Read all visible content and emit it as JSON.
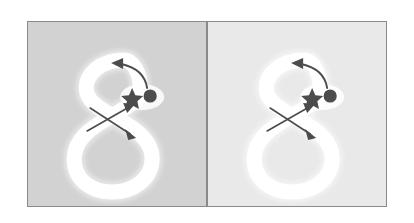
{
  "figure": {
    "background_color": "#ffffff",
    "border_color": "#8a8a8a",
    "marker_color": "#4c4c4c",
    "path_color": "#ffffff",
    "panels": [
      {
        "id": "panel-left",
        "label": "left-panel",
        "background_color": "#d2d2d2",
        "shape": "figure-eight",
        "markers": [
          {
            "name": "dot-marker",
            "glyph": "filled-circle",
            "color": "#4c4c4c",
            "x": 122,
            "y": 74
          },
          {
            "name": "star-marker",
            "glyph": "five-point-star",
            "color": "#4c4c4c",
            "x": 104,
            "y": 76
          }
        ],
        "arrows": [
          {
            "name": "curved-arrow",
            "style": "curved",
            "direction": "up-left",
            "color": "#4c4c4c"
          },
          {
            "name": "straight-arrow-up",
            "style": "straight",
            "direction": "up-right",
            "color": "#4c4c4c"
          },
          {
            "name": "straight-arrow-down",
            "style": "straight",
            "direction": "down-right",
            "color": "#4c4c4c"
          }
        ]
      },
      {
        "id": "panel-right",
        "label": "right-panel",
        "background_color": "#e9e9e9",
        "shape": "figure-eight",
        "markers": [
          {
            "name": "dot-marker",
            "glyph": "filled-circle",
            "color": "#4c4c4c",
            "x": 122,
            "y": 74
          },
          {
            "name": "star-marker",
            "glyph": "five-point-star",
            "color": "#4c4c4c",
            "x": 104,
            "y": 76
          }
        ],
        "arrows": [
          {
            "name": "curved-arrow",
            "style": "curved",
            "direction": "up-left",
            "color": "#4c4c4c"
          },
          {
            "name": "straight-arrow-up",
            "style": "straight",
            "direction": "up-right",
            "color": "#4c4c4c"
          },
          {
            "name": "straight-arrow-down",
            "style": "straight",
            "direction": "down-right",
            "color": "#4c4c4c"
          }
        ]
      }
    ]
  }
}
